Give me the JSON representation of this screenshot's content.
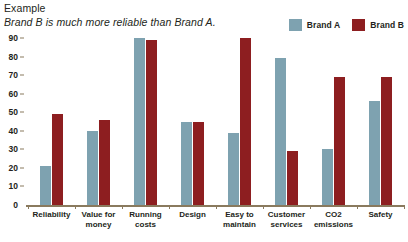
{
  "header": {
    "line1": "Example",
    "line2": "Brand B is much more reliable than Brand A."
  },
  "legend": {
    "entries": [
      {
        "label": "Brand A",
        "color": "#7ea2b0",
        "swatch_name": "legend-swatch-brand-a"
      },
      {
        "label": "Brand B",
        "color": "#8d1e20",
        "swatch_name": "legend-swatch-brand-b"
      }
    ]
  },
  "axis": {
    "zero_label": "0",
    "ticks": [
      "90",
      "80",
      "70",
      "60",
      "50",
      "40",
      "30",
      "20",
      "10"
    ]
  },
  "chart_data": {
    "type": "bar",
    "title": "Example",
    "subtitle": "Brand B is much more reliable than Brand A.",
    "xlabel": "",
    "ylabel": "",
    "ylim": [
      0,
      90
    ],
    "ytick_step": 10,
    "grid": true,
    "legend_position": "top-right",
    "categories": [
      "Reliability",
      "Value for money",
      "Running costs",
      "Design",
      "Easy to maintain",
      "Customer services",
      "CO2 emissions",
      "Safety"
    ],
    "series": [
      {
        "name": "Brand A",
        "color": "#7ea2b0",
        "values": [
          21,
          40,
          91,
          45,
          39,
          79,
          30,
          56
        ]
      },
      {
        "name": "Brand B",
        "color": "#8d1e20",
        "values": [
          49,
          46,
          89,
          45,
          90,
          29,
          69,
          69
        ]
      }
    ]
  }
}
